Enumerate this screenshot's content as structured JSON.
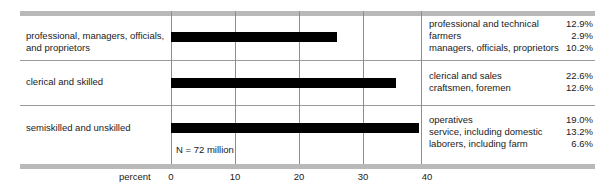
{
  "chart_data": {
    "type": "bar",
    "orientation": "horizontal",
    "title": "",
    "xlabel": "percent",
    "ylabel": "",
    "xlim": [
      0,
      40
    ],
    "xticks": [
      0,
      10,
      20,
      30,
      40
    ],
    "xtick_labels": [
      "0",
      "10",
      "20",
      "30",
      "40"
    ],
    "grid": true,
    "legend": false,
    "annotation": "N = 72 million",
    "categories": [
      "professional, managers, officials, and proprietors",
      "clerical and skilled",
      "semiskilled and unskilled"
    ],
    "values": [
      26.0,
      35.2,
      38.8
    ],
    "components": [
      {
        "group": "professional, managers, officials, and proprietors",
        "items": [
          {
            "label": "professional and technical",
            "value": 12.9,
            "display": "12.9%"
          },
          {
            "label": "farmers",
            "value": 2.9,
            "display": "2.9%"
          },
          {
            "label": "managers, officials, proprietors",
            "value": 10.2,
            "display": "10.2%"
          }
        ]
      },
      {
        "group": "clerical and skilled",
        "items": [
          {
            "label": "clerical and sales",
            "value": 22.6,
            "display": "22.6%"
          },
          {
            "label": "craftsmen, foremen",
            "value": 12.6,
            "display": "12.6%"
          }
        ]
      },
      {
        "group": "semiskilled and unskilled",
        "items": [
          {
            "label": "operatives",
            "value": 19.0,
            "display": "19.0%"
          },
          {
            "label": "service, including domestic",
            "value": 13.2,
            "display": "13.2%"
          },
          {
            "label": "laborers, including farm",
            "value": 6.6,
            "display": "6.6%"
          }
        ]
      }
    ],
    "colors": {
      "bar": "#000000",
      "grid": "#8d8d8d",
      "band": "#b9b9b9",
      "text": "#1a1a1a"
    }
  },
  "rows": {
    "r0": {
      "label_line1": "professional, managers, officials,",
      "label_line2": "and proprietors"
    },
    "r1": {
      "label_line1": "clerical and skilled",
      "label_line2": ""
    },
    "r2": {
      "label_line1": "semiskilled and unskilled",
      "label_line2": ""
    }
  },
  "axis": {
    "title": "percent",
    "t0": "0",
    "t10": "10",
    "t20": "20",
    "t30": "30",
    "t40": "40"
  },
  "note": {
    "n_text": "N = 72 million"
  },
  "breakdown": {
    "g0": {
      "i0": {
        "name": "professional and technical",
        "value": "12.9%"
      },
      "i1": {
        "name": "farmers",
        "value": "2.9%"
      },
      "i2": {
        "name": "managers, officials, proprietors",
        "value": "10.2%"
      }
    },
    "g1": {
      "i0": {
        "name": "clerical and sales",
        "value": "22.6%"
      },
      "i1": {
        "name": "craftsmen, foremen",
        "value": "12.6%"
      }
    },
    "g2": {
      "i0": {
        "name": "operatives",
        "value": "19.0%"
      },
      "i1": {
        "name": "service, including domestic",
        "value": "13.2%"
      },
      "i2": {
        "name": "laborers, including farm",
        "value": "6.6%"
      }
    }
  }
}
